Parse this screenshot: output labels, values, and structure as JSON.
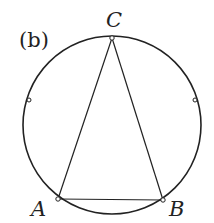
{
  "figure": {
    "panel_label": "(b)",
    "vertices": {
      "A": "A",
      "B": "B",
      "C": "C"
    },
    "shape": "isosceles triangle ABC inscribed in circle",
    "circle": {
      "cx": 112,
      "cy": 125,
      "r": 89
    },
    "points": {
      "A": {
        "x": 58,
        "y": 199
      },
      "B": {
        "x": 163,
        "y": 200
      },
      "C": {
        "x": 112,
        "y": 38
      },
      "left_mark": {
        "x": 29,
        "y": 100
      },
      "right_mark": {
        "x": 195,
        "y": 100
      }
    },
    "colors": {
      "stroke": "#222222",
      "background": "#ffffff"
    }
  }
}
